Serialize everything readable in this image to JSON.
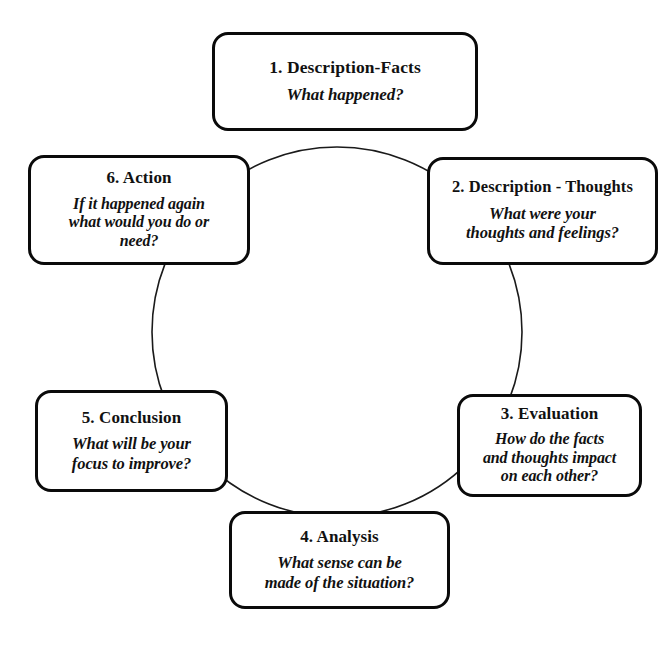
{
  "diagram": {
    "name": "reflective-cycle",
    "shape": "circle",
    "stroke_color": "#0a0a0a",
    "background_color": "#ffffff",
    "arc": {
      "center_x": 337,
      "center_y": 332,
      "radius": 185
    },
    "nodes": [
      {
        "id": "node-1",
        "title": "1. Description-Facts",
        "prompt_lines": [
          "What happened?"
        ]
      },
      {
        "id": "node-2",
        "title": "2. Description - Thoughts",
        "prompt_lines": [
          "What were your",
          "thoughts and feelings?"
        ]
      },
      {
        "id": "node-3",
        "title": "3. Evaluation",
        "prompt_lines": [
          "How do the facts",
          "and thoughts impact",
          "on each other?"
        ]
      },
      {
        "id": "node-4",
        "title": "4. Analysis",
        "prompt_lines": [
          "What sense can be",
          "made of the situation?"
        ]
      },
      {
        "id": "node-5",
        "title": "5. Conclusion",
        "prompt_lines": [
          "What will be your",
          "focus to improve?"
        ]
      },
      {
        "id": "node-6",
        "title": "6. Action",
        "prompt_lines": [
          "If it happened again",
          "what would you do or",
          "need?"
        ]
      }
    ]
  }
}
